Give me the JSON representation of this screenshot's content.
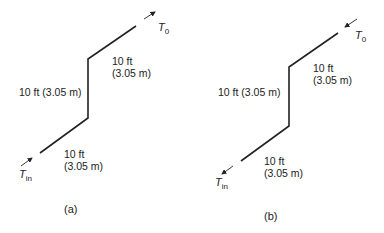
{
  "diagram_a": {
    "caption": "(a)",
    "outlet_label": "T",
    "outlet_sub": "0",
    "inlet_label": "T",
    "inlet_sub": "in",
    "vertical_segment": "10 ft (3.05 m)",
    "upper_segment_ft": "10 ft",
    "upper_segment_m": "(3.05 m)",
    "lower_segment_ft": "10 ft",
    "lower_segment_m": "(3.05 m)",
    "flow_direction": "inlet-to-outlet (up-right)"
  },
  "diagram_b": {
    "caption": "(b)",
    "outlet_label": "T",
    "outlet_sub": "0",
    "inlet_label": "T",
    "inlet_sub": "in",
    "vertical_segment": "10 ft (3.05 m)",
    "upper_segment_ft": "10 ft",
    "upper_segment_m": "(3.05 m)",
    "lower_segment_ft": "10 ft",
    "lower_segment_m": "(3.05 m)",
    "flow_direction": "reversed (down-left)"
  },
  "colors": {
    "line": "#222222",
    "background": "#ffffff"
  }
}
